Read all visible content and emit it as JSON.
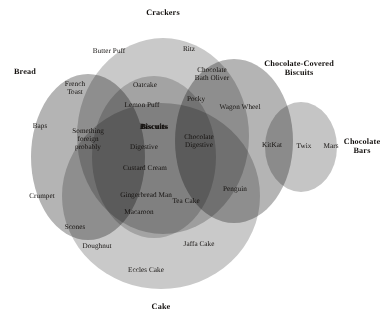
{
  "figure": {
    "kind": "euler-diagram",
    "background_color": "#ffffff",
    "text_color": "#14110f"
  },
  "sets": [
    {
      "id": "crackers",
      "name": "Crackers",
      "shape": "ellipse",
      "cx": 163,
      "cy": 136,
      "rx": 86,
      "ry": 98,
      "fill": "#c9c9c9",
      "title_x": 163,
      "title_y": 13
    },
    {
      "id": "bread",
      "name": "Bread",
      "shape": "ellipse",
      "cx": 88,
      "cy": 157,
      "rx": 57,
      "ry": 83,
      "fill": "#b4b4b4",
      "title_x": 25,
      "title_y": 72
    },
    {
      "id": "cake",
      "name": "Cake",
      "shape": "ellipse",
      "cx": 161,
      "cy": 196,
      "rx": 99,
      "ry": 93,
      "fill": "#c9c9c9",
      "title_x": 161,
      "title_y": 307
    },
    {
      "id": "chocolate-covered-biscuits",
      "name": "Chocolate-Covered Biscuits",
      "shape": "ellipse",
      "cx": 234,
      "cy": 141,
      "rx": 59,
      "ry": 82,
      "fill": "#b4b4b4",
      "title_x": 299,
      "title_y": 69,
      "title_lines": [
        "Chocolate-Covered",
        "Biscuits"
      ]
    },
    {
      "id": "chocolate-bars",
      "name": "Chocolate Bars",
      "shape": "ellipse",
      "cx": 301,
      "cy": 147,
      "rx": 36,
      "ry": 45,
      "fill": "#c5c5c5",
      "title_x": 362,
      "title_y": 147,
      "title_lines": [
        "Chocolate",
        "Bars"
      ]
    },
    {
      "id": "biscuits",
      "name": "Biscuits",
      "shape": "ellipse",
      "cx": 154,
      "cy": 157,
      "rx": 62,
      "ry": 81,
      "fill": "#cfcfcf",
      "title_x": 154,
      "title_y": 127
    }
  ],
  "items": [
    {
      "label": "Butter Puff",
      "x": 109,
      "y": 52,
      "region": "crackers"
    },
    {
      "label": "Ritz",
      "x": 189,
      "y": 50,
      "region": "crackers"
    },
    {
      "label": "French\nToast",
      "x": 75,
      "y": 89,
      "region": "bread-crackers"
    },
    {
      "label": "Baps",
      "x": 40,
      "y": 127,
      "region": "bread"
    },
    {
      "label": "Crumpet",
      "x": 42,
      "y": 197,
      "region": "bread"
    },
    {
      "label": "Something\nforeign\nprobably",
      "x": 88,
      "y": 140,
      "region": "bread-biscuits"
    },
    {
      "label": "Scones",
      "x": 75,
      "y": 228,
      "region": "bread-cake"
    },
    {
      "label": "Oatcake",
      "x": 145,
      "y": 86,
      "region": "crackers-biscuits"
    },
    {
      "label": "Lemon Puff",
      "x": 142,
      "y": 106,
      "region": "crackers-biscuits"
    },
    {
      "label": "Digestive",
      "x": 144,
      "y": 148,
      "region": "biscuits"
    },
    {
      "label": "Custard Cream",
      "x": 145,
      "y": 169,
      "region": "biscuits"
    },
    {
      "label": "Gingerbread Man",
      "x": 146,
      "y": 196,
      "region": "biscuits-cake"
    },
    {
      "label": "Macaroon",
      "x": 139,
      "y": 213,
      "region": "biscuits-cake"
    },
    {
      "label": "Chocolate\nBath Oliver",
      "x": 212,
      "y": 75,
      "region": "crackers-ccb"
    },
    {
      "label": "Pocky",
      "x": 196,
      "y": 100,
      "region": "biscuits-ccb"
    },
    {
      "label": "Wagon Wheel",
      "x": 240,
      "y": 108,
      "region": "ccb"
    },
    {
      "label": "Chocolate\nDigestive",
      "x": 199,
      "y": 142,
      "region": "biscuits-ccb"
    },
    {
      "label": "Tea Cake",
      "x": 186,
      "y": 202,
      "region": "biscuits-ccb-cake"
    },
    {
      "label": "Penguin",
      "x": 235,
      "y": 190,
      "region": "ccb"
    },
    {
      "label": "KitKat",
      "x": 272,
      "y": 146,
      "region": "ccb-chocolate-bars"
    },
    {
      "label": "Twix",
      "x": 304,
      "y": 147,
      "region": "chocolate-bars"
    },
    {
      "label": "Mars",
      "x": 331,
      "y": 147,
      "region": "chocolate-bars"
    },
    {
      "label": "Doughnut",
      "x": 97,
      "y": 247,
      "region": "cake"
    },
    {
      "label": "Jaffa Cake",
      "x": 199,
      "y": 245,
      "region": "cake"
    },
    {
      "label": "Eccles Cake",
      "x": 146,
      "y": 271,
      "region": "cake"
    }
  ],
  "emphasized_item": {
    "label": "Biscuits",
    "x": 154,
    "y": 127
  },
  "chart_data": {
    "type": "table",
    "categories": [
      "Crackers",
      "Bread",
      "Biscuits",
      "Chocolate-Covered Biscuits",
      "Chocolate Bars",
      "Cake"
    ],
    "regions": [
      {
        "sets": [
          "Crackers"
        ],
        "members": [
          "Butter Puff",
          "Ritz"
        ]
      },
      {
        "sets": [
          "Bread"
        ],
        "members": [
          "Baps",
          "Crumpet"
        ]
      },
      {
        "sets": [
          "Bread",
          "Crackers"
        ],
        "members": [
          "French Toast"
        ]
      },
      {
        "sets": [
          "Bread",
          "Biscuits"
        ],
        "members": [
          "Something foreign probably"
        ]
      },
      {
        "sets": [
          "Bread",
          "Cake"
        ],
        "members": [
          "Scones"
        ]
      },
      {
        "sets": [
          "Crackers",
          "Biscuits"
        ],
        "members": [
          "Oatcake",
          "Lemon Puff"
        ]
      },
      {
        "sets": [
          "Crackers",
          "Chocolate-Covered Biscuits"
        ],
        "members": [
          "Chocolate Bath Oliver"
        ]
      },
      {
        "sets": [
          "Biscuits"
        ],
        "members": [
          "Digestive",
          "Custard Cream"
        ]
      },
      {
        "sets": [
          "Biscuits",
          "Cake"
        ],
        "members": [
          "Gingerbread Man",
          "Macaroon"
        ]
      },
      {
        "sets": [
          "Biscuits",
          "Chocolate-Covered Biscuits"
        ],
        "members": [
          "Pocky",
          "Chocolate Digestive"
        ]
      },
      {
        "sets": [
          "Biscuits",
          "Chocolate-Covered Biscuits",
          "Cake"
        ],
        "members": [
          "Tea Cake"
        ]
      },
      {
        "sets": [
          "Chocolate-Covered Biscuits"
        ],
        "members": [
          "Wagon Wheel",
          "Penguin"
        ]
      },
      {
        "sets": [
          "Chocolate-Covered Biscuits",
          "Chocolate Bars"
        ],
        "members": [
          "KitKat"
        ]
      },
      {
        "sets": [
          "Chocolate Bars"
        ],
        "members": [
          "Twix",
          "Mars"
        ]
      },
      {
        "sets": [
          "Cake"
        ],
        "members": [
          "Doughnut",
          "Jaffa Cake",
          "Eccles Cake"
        ]
      }
    ]
  }
}
